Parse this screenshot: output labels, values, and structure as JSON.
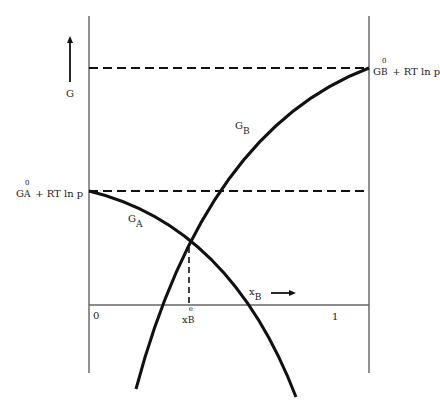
{
  "diagram": {
    "type": "free-energy-composition-diagram",
    "y_axis": {
      "symbol": "G",
      "arrow": "up"
    },
    "x_axis": {
      "symbol": "x",
      "subscript": "B",
      "arrow": "right",
      "tick_left": "0",
      "tick_right": "1"
    },
    "curves": [
      {
        "name": "G_A",
        "symbol": "G",
        "subscript": "A"
      },
      {
        "name": "G_B",
        "symbol": "G",
        "subscript": "B"
      }
    ],
    "reference_levels": {
      "A": {
        "main": "G",
        "superscript": "0",
        "subscript": "A",
        "suffix": "+ RT ln p"
      },
      "B": {
        "main": "G",
        "superscript": "0",
        "subscript": "B",
        "suffix": "+ RT ln p"
      }
    },
    "equilibrium": {
      "main": "x",
      "superscript": "e",
      "subscript": "B"
    }
  },
  "colors": {
    "line": "#111111",
    "axis": "#555555",
    "background": "#ffffff"
  }
}
